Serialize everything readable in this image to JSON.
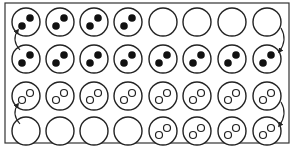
{
  "diagram": {
    "frame": {
      "x": 5,
      "y": 3,
      "width": 284,
      "height": 140,
      "stroke": "#333333"
    },
    "circle_radius": 14,
    "column_x": [
      26,
      60,
      94,
      128,
      163,
      197,
      232,
      267
    ],
    "row_y": [
      22,
      59,
      96,
      131
    ],
    "rows": [
      {
        "name": "row-1",
        "cells": [
          "filled",
          "filled",
          "filled",
          "filled",
          "empty",
          "empty",
          "empty",
          "empty"
        ]
      },
      {
        "name": "row-2",
        "cells": [
          "filled",
          "filled",
          "filled",
          "filled",
          "filled",
          "filled",
          "filled",
          "filled"
        ]
      },
      {
        "name": "row-3",
        "cells": [
          "open",
          "open",
          "open",
          "open",
          "open",
          "open",
          "open",
          "open"
        ]
      },
      {
        "name": "row-4",
        "cells": [
          "empty",
          "empty",
          "empty",
          "empty",
          "open",
          "open",
          "open",
          "open"
        ]
      }
    ],
    "arrows": [
      {
        "name": "arrow-left-top",
        "from": [
          20,
          50
        ],
        "to": [
          18,
          30
        ],
        "side": "left"
      },
      {
        "name": "arrow-right-top",
        "from": [
          281,
          28
        ],
        "to": [
          279,
          52
        ],
        "side": "right"
      },
      {
        "name": "arrow-left-bottom",
        "from": [
          20,
          124
        ],
        "to": [
          18,
          104
        ],
        "side": "left"
      },
      {
        "name": "arrow-right-bottom",
        "from": [
          281,
          102
        ],
        "to": [
          279,
          126
        ],
        "side": "right"
      }
    ],
    "colors": {
      "stroke": "#222222",
      "fill_dot": "#111111",
      "background": "#ffffff"
    }
  }
}
